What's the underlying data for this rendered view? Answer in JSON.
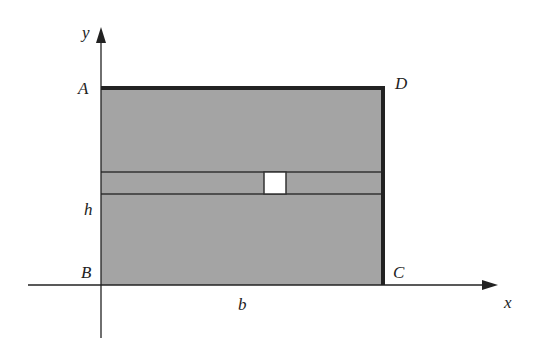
{
  "diagram": {
    "type": "rectangle-on-axes",
    "colors": {
      "fill": "#a4a4a4",
      "line": "#222222",
      "strip_square": "#ffffff",
      "background": "#ffffff"
    },
    "axes": {
      "x_label": "x",
      "y_label": "y"
    },
    "vertices": {
      "A": "A",
      "B": "B",
      "C": "C",
      "D": "D"
    },
    "dimensions": {
      "height": "h",
      "base": "b"
    }
  }
}
